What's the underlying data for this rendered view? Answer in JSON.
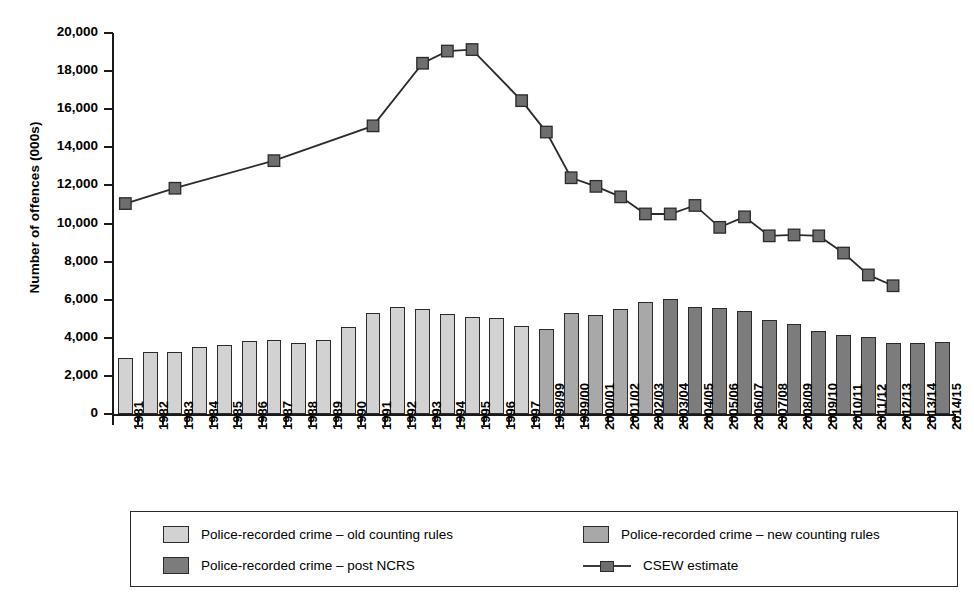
{
  "chart_data": {
    "type": "bar",
    "title": "",
    "xlabel": "",
    "ylabel": "Number of offences (000s)",
    "ylim": [
      0,
      20000
    ],
    "ytick_values": [
      0,
      2000,
      4000,
      6000,
      8000,
      10000,
      12000,
      14000,
      16000,
      18000,
      20000
    ],
    "ytick_labels": [
      "0",
      "2,000",
      "4,000",
      "6,000",
      "8,000",
      "10,000",
      "12,000",
      "14,000",
      "16,000",
      "18,000",
      "20,000"
    ],
    "grid": false,
    "legend_position": "bottom",
    "categories": [
      "1981",
      "1982",
      "1983",
      "1984",
      "1985",
      "1986",
      "1987",
      "1988",
      "1989",
      "1990",
      "1991",
      "1992",
      "1993",
      "1994",
      "1995",
      "1996",
      "1997",
      "1998/99",
      "1999/00",
      "2000/01",
      "2001/02",
      "2002/03",
      "2003/04",
      "2004/05",
      "2005/06",
      "2006/07",
      "2007/08",
      "2008/09",
      "2009/10",
      "2010/11",
      "2011/12",
      "2012/13",
      "2013/14",
      "2014/15"
    ],
    "series": [
      {
        "name": "Police-recorded crime – old counting rules",
        "type": "bar",
        "color": "#d2d2d2",
        "values": [
          2964,
          3262,
          3247,
          3499,
          3612,
          3847,
          3892,
          3716,
          3871,
          4544,
          5276,
          5592,
          5526,
          5253,
          5100,
          5037,
          4598,
          null,
          null,
          null,
          null,
          null,
          null,
          null,
          null,
          null,
          null,
          null,
          null,
          null,
          null,
          null,
          null,
          null
        ]
      },
      {
        "name": "Police-recorded crime – new counting rules",
        "type": "bar",
        "color": "#a8a8a8",
        "values": [
          null,
          null,
          null,
          null,
          null,
          null,
          null,
          null,
          null,
          null,
          null,
          null,
          null,
          null,
          null,
          null,
          null,
          4482,
          5301,
          5171,
          5525,
          5899,
          null,
          null,
          null,
          null,
          null,
          null,
          null,
          null,
          null,
          null,
          null,
          null
        ]
      },
      {
        "name": "Police-recorded crime – post NCRS",
        "type": "bar",
        "color": "#7c7c7c",
        "values": [
          null,
          null,
          null,
          null,
          null,
          null,
          null,
          null,
          null,
          null,
          null,
          null,
          null,
          null,
          null,
          null,
          null,
          null,
          null,
          null,
          null,
          null,
          6014,
          5638,
          5556,
          5428,
          4951,
          4703,
          4338,
          4151,
          4022,
          3731,
          3704,
          3766
        ]
      },
      {
        "name": "CSEW estimate",
        "type": "line",
        "color": "#6e6e6e",
        "marker": "square",
        "values": [
          11045,
          null,
          11851,
          null,
          null,
          null,
          13301,
          null,
          null,
          null,
          15125,
          null,
          18413,
          19050,
          19130,
          null,
          16450,
          14800,
          12400,
          11950,
          11400,
          10500,
          10500,
          10950,
          9800,
          10350,
          9350,
          9400,
          9350,
          8450,
          7300,
          6730,
          null,
          null
        ],
        "note": "markers plotted at 1981, 1983, 1987, 1991, 1993–2012/13"
      }
    ]
  },
  "legend": {
    "entries": [
      {
        "label": "Police-recorded crime – old counting rules",
        "kind": "swatch",
        "color": "#d2d2d2"
      },
      {
        "label": "Police-recorded crime – new counting rules",
        "kind": "swatch",
        "color": "#a8a8a8"
      },
      {
        "label": "Police-recorded crime – post NCRS",
        "kind": "swatch",
        "color": "#7c7c7c"
      },
      {
        "label": "CSEW estimate",
        "kind": "line",
        "color": "#6e6e6e"
      }
    ]
  }
}
